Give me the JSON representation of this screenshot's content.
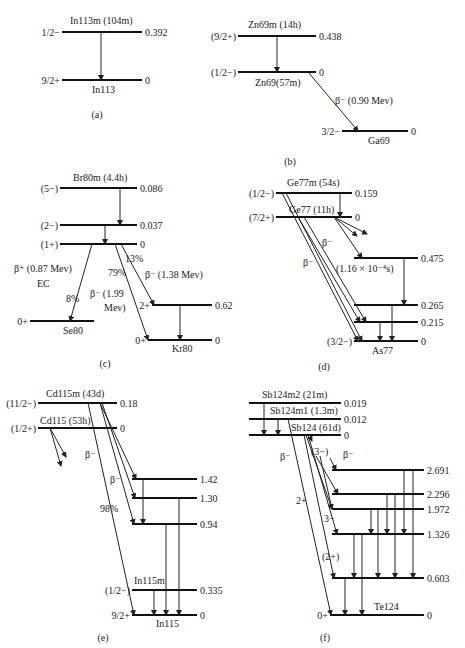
{
  "figure": {
    "panels": [
      {
        "id": "a",
        "caption": "(a)",
        "caption_pos": [
          97,
          118
        ],
        "levels": [
          {
            "x1": 62,
            "x2": 142,
            "y": 32,
            "spin": "1/2−",
            "energy": "0.392",
            "nuclide": "In113m (104m)",
            "nuclide_pos": [
              70,
              24
            ]
          },
          {
            "x1": 62,
            "x2": 142,
            "y": 80,
            "spin": "9/2+",
            "energy": "0",
            "nuclide": "In113",
            "nuclide_pos": [
              92,
              93
            ]
          }
        ],
        "transitions": [
          {
            "x1": 101,
            "y1": 32,
            "x2": 101,
            "y2": 80
          }
        ],
        "labels": []
      },
      {
        "id": "b",
        "caption": "(b)",
        "caption_pos": [
          290,
          165
        ],
        "levels": [
          {
            "x1": 238,
            "x2": 316,
            "y": 36,
            "spin": "(9/2+)",
            "energy": "0.438",
            "nuclide": "Zn69m (14h)",
            "nuclide_pos": [
              248,
              28
            ]
          },
          {
            "x1": 238,
            "x2": 316,
            "y": 72,
            "spin": "(1/2−)",
            "energy": "0",
            "nuclide": "Zn69(57m)",
            "nuclide_pos": [
              255,
              86
            ]
          },
          {
            "x1": 342,
            "x2": 408,
            "y": 131,
            "spin": "3/2−",
            "energy": "0",
            "nuclide": "Ga69",
            "nuclide_pos": [
              368,
              144
            ]
          }
        ],
        "transitions": [
          {
            "x1": 277,
            "y1": 36,
            "x2": 277,
            "y2": 72
          },
          {
            "x1": 308,
            "y1": 72,
            "x2": 358,
            "y2": 131
          }
        ],
        "labels": [
          {
            "text": "β⁻ (0.90 Mev)",
            "x": 335,
            "y": 104
          }
        ]
      },
      {
        "id": "c",
        "caption": "(c)",
        "caption_pos": [
          105,
          367
        ],
        "levels": [
          {
            "x1": 60,
            "x2": 137,
            "y": 188,
            "spin": "(5−)",
            "energy": "0.086",
            "nuclide": "Br80m (4.4h)",
            "nuclide_pos": [
              73,
              181
            ]
          },
          {
            "x1": 60,
            "x2": 137,
            "y": 225,
            "spin": "(2−)",
            "energy": "0.037",
            "nuclide": "",
            "nuclide_pos": [
              0,
              0
            ]
          },
          {
            "x1": 60,
            "x2": 137,
            "y": 244,
            "spin": "(1+)",
            "energy": "0",
            "nuclide": "",
            "nuclide_pos": [
              0,
              0
            ]
          },
          {
            "x1": 30,
            "x2": 94,
            "y": 321,
            "spin": "0+",
            "energy": "",
            "nuclide": "Se80",
            "nuclide_pos": [
              63,
              334
            ]
          },
          {
            "x1": 152,
            "x2": 212,
            "y": 305,
            "spin": "2+",
            "energy": "0.62",
            "nuclide": "",
            "nuclide_pos": [
              0,
              0
            ]
          },
          {
            "x1": 148,
            "x2": 212,
            "y": 340,
            "spin": "0+",
            "energy": "0",
            "nuclide": "Kr80",
            "nuclide_pos": [
              172,
              352
            ]
          }
        ],
        "transitions": [
          {
            "x1": 120,
            "y1": 188,
            "x2": 120,
            "y2": 225
          },
          {
            "x1": 105,
            "y1": 225,
            "x2": 105,
            "y2": 244
          },
          {
            "x1": 92,
            "y1": 244,
            "x2": 70,
            "y2": 321
          },
          {
            "x1": 115,
            "y1": 244,
            "x2": 148,
            "y2": 340
          },
          {
            "x1": 121,
            "y1": 244,
            "x2": 154,
            "y2": 305
          },
          {
            "x1": 180,
            "y1": 305,
            "x2": 180,
            "y2": 340
          }
        ],
        "labels": [
          {
            "text": "13%",
            "x": 125,
            "y": 262
          },
          {
            "text": "β⁺ (0.87 Mev)",
            "x": 14,
            "y": 272
          },
          {
            "text": "EC",
            "x": 37,
            "y": 287
          },
          {
            "text": "79%",
            "x": 108,
            "y": 276
          },
          {
            "text": "β⁻ (1.38 Mev)",
            "x": 145,
            "y": 278
          },
          {
            "text": "β⁻ (1.99",
            "x": 90,
            "y": 297
          },
          {
            "text": "Mev)",
            "x": 104,
            "y": 311
          },
          {
            "text": "8%",
            "x": 66,
            "y": 302
          }
        ]
      },
      {
        "id": "d",
        "caption": "(d)",
        "caption_pos": [
          324,
          370
        ],
        "levels": [
          {
            "x1": 276,
            "x2": 352,
            "y": 193,
            "spin": "(1/2−)",
            "energy": "0.159",
            "nuclide": "Ge77m (54s)",
            "nuclide_pos": [
              287,
              186
            ]
          },
          {
            "x1": 276,
            "x2": 352,
            "y": 217,
            "spin": "(7/2+)",
            "energy": "0",
            "nuclide": "Ge77 (11h)",
            "nuclide_pos": [
              289,
              213
            ]
          },
          {
            "x1": 354,
            "x2": 418,
            "y": 258,
            "spin": "",
            "energy": "0.475",
            "nuclide": "",
            "nuclide_pos": [
              0,
              0
            ]
          },
          {
            "x1": 354,
            "x2": 418,
            "y": 305,
            "spin": "",
            "energy": "0.265",
            "nuclide": "",
            "nuclide_pos": [
              0,
              0
            ]
          },
          {
            "x1": 354,
            "x2": 418,
            "y": 322,
            "spin": "",
            "energy": "0.215",
            "nuclide": "",
            "nuclide_pos": [
              0,
              0
            ]
          },
          {
            "x1": 354,
            "x2": 418,
            "y": 341,
            "spin": "(3/2−)",
            "energy": "0",
            "nuclide": "As77",
            "nuclide_pos": [
              372,
              354
            ]
          }
        ],
        "transitions": [
          {
            "x1": 340,
            "y1": 193,
            "x2": 340,
            "y2": 217
          },
          {
            "x1": 282,
            "y1": 193,
            "x2": 358,
            "y2": 341
          },
          {
            "x1": 286,
            "y1": 193,
            "x2": 362,
            "y2": 341
          },
          {
            "x1": 298,
            "y1": 217,
            "x2": 360,
            "y2": 322
          },
          {
            "x1": 304,
            "y1": 217,
            "x2": 366,
            "y2": 322
          },
          {
            "x1": 334,
            "y1": 217,
            "x2": 362,
            "y2": 258
          },
          {
            "x1": 334,
            "y1": 217,
            "x2": 357,
            "y2": 236
          },
          {
            "x1": 334,
            "y1": 217,
            "x2": 367,
            "y2": 234
          },
          {
            "x1": 404,
            "y1": 258,
            "x2": 404,
            "y2": 305
          },
          {
            "x1": 392,
            "y1": 305,
            "x2": 392,
            "y2": 341
          },
          {
            "x1": 380,
            "y1": 322,
            "x2": 380,
            "y2": 341
          }
        ],
        "labels": [
          {
            "text": "β⁻",
            "x": 322,
            "y": 246
          },
          {
            "text": "β⁻",
            "x": 303,
            "y": 266
          },
          {
            "text": "(1.16 × 10⁻⁴s)",
            "x": 336,
            "y": 272
          }
        ]
      },
      {
        "id": "e",
        "caption": "(e)",
        "caption_pos": [
          103,
          641
        ],
        "levels": [
          {
            "x1": 38,
            "x2": 117,
            "y": 403,
            "spin": "(11/2−)",
            "energy": "0.18",
            "nuclide": "Cd115m (43d)",
            "nuclide_pos": [
              46,
              397
            ]
          },
          {
            "x1": 38,
            "x2": 117,
            "y": 428,
            "spin": "(1/2+)",
            "energy": "0",
            "nuclide": "Cd115 (53h)",
            "nuclide_pos": [
              40,
              424
            ]
          },
          {
            "x1": 132,
            "x2": 197,
            "y": 479,
            "spin": "",
            "energy": "1.42",
            "nuclide": "",
            "nuclide_pos": [
              0,
              0
            ]
          },
          {
            "x1": 132,
            "x2": 197,
            "y": 498,
            "spin": "",
            "energy": "1.30",
            "nuclide": "",
            "nuclide_pos": [
              0,
              0
            ]
          },
          {
            "x1": 132,
            "x2": 197,
            "y": 524,
            "spin": "",
            "energy": "0.94",
            "nuclide": "",
            "nuclide_pos": [
              0,
              0
            ]
          },
          {
            "x1": 132,
            "x2": 197,
            "y": 590,
            "spin": "(1/2−)",
            "energy": "0.335",
            "nuclide": "In115m",
            "nuclide_pos": [
              134,
              584
            ]
          },
          {
            "x1": 132,
            "x2": 197,
            "y": 615,
            "spin": "9/2+",
            "energy": "0",
            "nuclide": "In115",
            "nuclide_pos": [
              156,
              627
            ]
          }
        ],
        "transitions": [
          {
            "x1": 50,
            "y1": 428,
            "x2": 66,
            "y2": 457
          },
          {
            "x1": 50,
            "y1": 428,
            "x2": 61,
            "y2": 466
          },
          {
            "x1": 88,
            "y1": 403,
            "x2": 134,
            "y2": 615
          },
          {
            "x1": 100,
            "y1": 403,
            "x2": 136,
            "y2": 479
          },
          {
            "x1": 102,
            "y1": 403,
            "x2": 135,
            "y2": 498
          },
          {
            "x1": 100,
            "y1": 403,
            "x2": 134,
            "y2": 524
          },
          {
            "x1": 143,
            "y1": 479,
            "x2": 143,
            "y2": 524
          },
          {
            "x1": 179,
            "y1": 498,
            "x2": 179,
            "y2": 615
          },
          {
            "x1": 166,
            "y1": 524,
            "x2": 166,
            "y2": 615
          },
          {
            "x1": 154,
            "y1": 590,
            "x2": 154,
            "y2": 615
          }
        ],
        "labels": [
          {
            "text": "β⁻",
            "x": 85,
            "y": 458
          },
          {
            "text": "β⁻",
            "x": 110,
            "y": 483
          },
          {
            "text": "98%",
            "x": 100,
            "y": 512
          }
        ]
      },
      {
        "id": "f",
        "caption": "(f)",
        "caption_pos": [
          325,
          641
        ],
        "levels": [
          {
            "x1": 249,
            "x2": 341,
            "y": 403,
            "spin": "",
            "energy": "0.019",
            "nuclide": "Sb124m2 (21m)",
            "nuclide_pos": [
              262,
              398
            ]
          },
          {
            "x1": 249,
            "x2": 341,
            "y": 419,
            "spin": "",
            "energy": "0.012",
            "nuclide": "Sb124m1 (1.3m)",
            "nuclide_pos": [
              270,
              414
            ]
          },
          {
            "x1": 249,
            "x2": 341,
            "y": 435,
            "spin": "",
            "energy": "0",
            "nuclide": "Sb124 (61d)",
            "nuclide_pos": [
              291,
              431
            ]
          },
          {
            "x1": 332,
            "x2": 424,
            "y": 470,
            "spin": "",
            "energy": "2.691",
            "nuclide": "",
            "nuclide_pos": [
              0,
              0
            ]
          },
          {
            "x1": 332,
            "x2": 424,
            "y": 494,
            "spin": "",
            "energy": "2.296",
            "nuclide": "",
            "nuclide_pos": [
              0,
              0
            ]
          },
          {
            "x1": 332,
            "x2": 424,
            "y": 509,
            "spin": "",
            "energy": "1.972",
            "nuclide": "",
            "nuclide_pos": [
              0,
              0
            ]
          },
          {
            "x1": 332,
            "x2": 424,
            "y": 534,
            "spin": "",
            "energy": "1.326",
            "nuclide": "",
            "nuclide_pos": [
              0,
              0
            ]
          },
          {
            "x1": 332,
            "x2": 424,
            "y": 578,
            "spin": "",
            "energy": "0.603",
            "nuclide": "",
            "nuclide_pos": [
              0,
              0
            ]
          },
          {
            "x1": 330,
            "x2": 424,
            "y": 615,
            "spin": "0+",
            "energy": "0",
            "nuclide": "Te124",
            "nuclide_pos": [
              374,
              610
            ]
          }
        ],
        "transitions": [
          {
            "x1": 264,
            "y1": 403,
            "x2": 264,
            "y2": 435
          },
          {
            "x1": 278,
            "y1": 419,
            "x2": 278,
            "y2": 435
          },
          {
            "x1": 288,
            "y1": 419,
            "x2": 331,
            "y2": 615
          },
          {
            "x1": 304,
            "y1": 435,
            "x2": 334,
            "y2": 578
          },
          {
            "x1": 306,
            "y1": 435,
            "x2": 332,
            "y2": 509
          },
          {
            "x1": 308,
            "y1": 435,
            "x2": 337,
            "y2": 534
          },
          {
            "x1": 316,
            "y1": 456,
            "x2": 338,
            "y2": 494
          },
          {
            "x1": 320,
            "y1": 456,
            "x2": 332,
            "y2": 509
          },
          {
            "x1": 330,
            "y1": 458,
            "x2": 336,
            "y2": 470
          },
          {
            "x1": 310,
            "y1": 437,
            "x2": 312,
            "y2": 441
          },
          {
            "x1": 404,
            "y1": 470,
            "x2": 404,
            "y2": 534
          },
          {
            "x1": 413,
            "y1": 470,
            "x2": 413,
            "y2": 578
          },
          {
            "x1": 387,
            "y1": 494,
            "x2": 387,
            "y2": 534
          },
          {
            "x1": 395,
            "y1": 494,
            "x2": 395,
            "y2": 578
          },
          {
            "x1": 371,
            "y1": 509,
            "x2": 371,
            "y2": 534
          },
          {
            "x1": 378,
            "y1": 509,
            "x2": 378,
            "y2": 578
          },
          {
            "x1": 354,
            "y1": 534,
            "x2": 354,
            "y2": 578
          },
          {
            "x1": 362,
            "y1": 534,
            "x2": 362,
            "y2": 615
          },
          {
            "x1": 345,
            "y1": 578,
            "x2": 345,
            "y2": 615
          }
        ],
        "labels": [
          {
            "text": "(3−)",
            "x": 311,
            "y": 455
          },
          {
            "text": "β⁻",
            "x": 343,
            "y": 458
          },
          {
            "text": "β⁻",
            "x": 280,
            "y": 460
          },
          {
            "text": "2+",
            "x": 296,
            "y": 504
          },
          {
            "text": "3−",
            "x": 324,
            "y": 522
          },
          {
            "text": "(2+)",
            "x": 322,
            "y": 560
          }
        ]
      }
    ]
  }
}
